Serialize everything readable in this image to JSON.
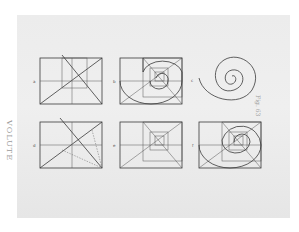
{
  "plate": {
    "title": "VOLUTE",
    "figure_label": "Fig. 63"
  },
  "figures": [
    {
      "id": "fig-top-left",
      "label": "a",
      "content": "rectangle with diagonals and inner construction square"
    },
    {
      "id": "fig-top-middle",
      "label": "b",
      "content": "nested squares with volute arcs"
    },
    {
      "id": "fig-top-right",
      "label": "c",
      "content": "finished spiral volute"
    },
    {
      "id": "fig-bottom-left",
      "label": "d",
      "content": "rectangle with diagonals and dotted construction lines"
    },
    {
      "id": "fig-bottom-middle",
      "label": "e",
      "content": "nested squares with diagonals"
    },
    {
      "id": "fig-bottom-right",
      "label": "f",
      "content": "nested squares with full volute arcs"
    }
  ],
  "colors": {
    "paper": "#ececec",
    "ink": "#3a3a3a",
    "caption": "#9a9a9a"
  }
}
